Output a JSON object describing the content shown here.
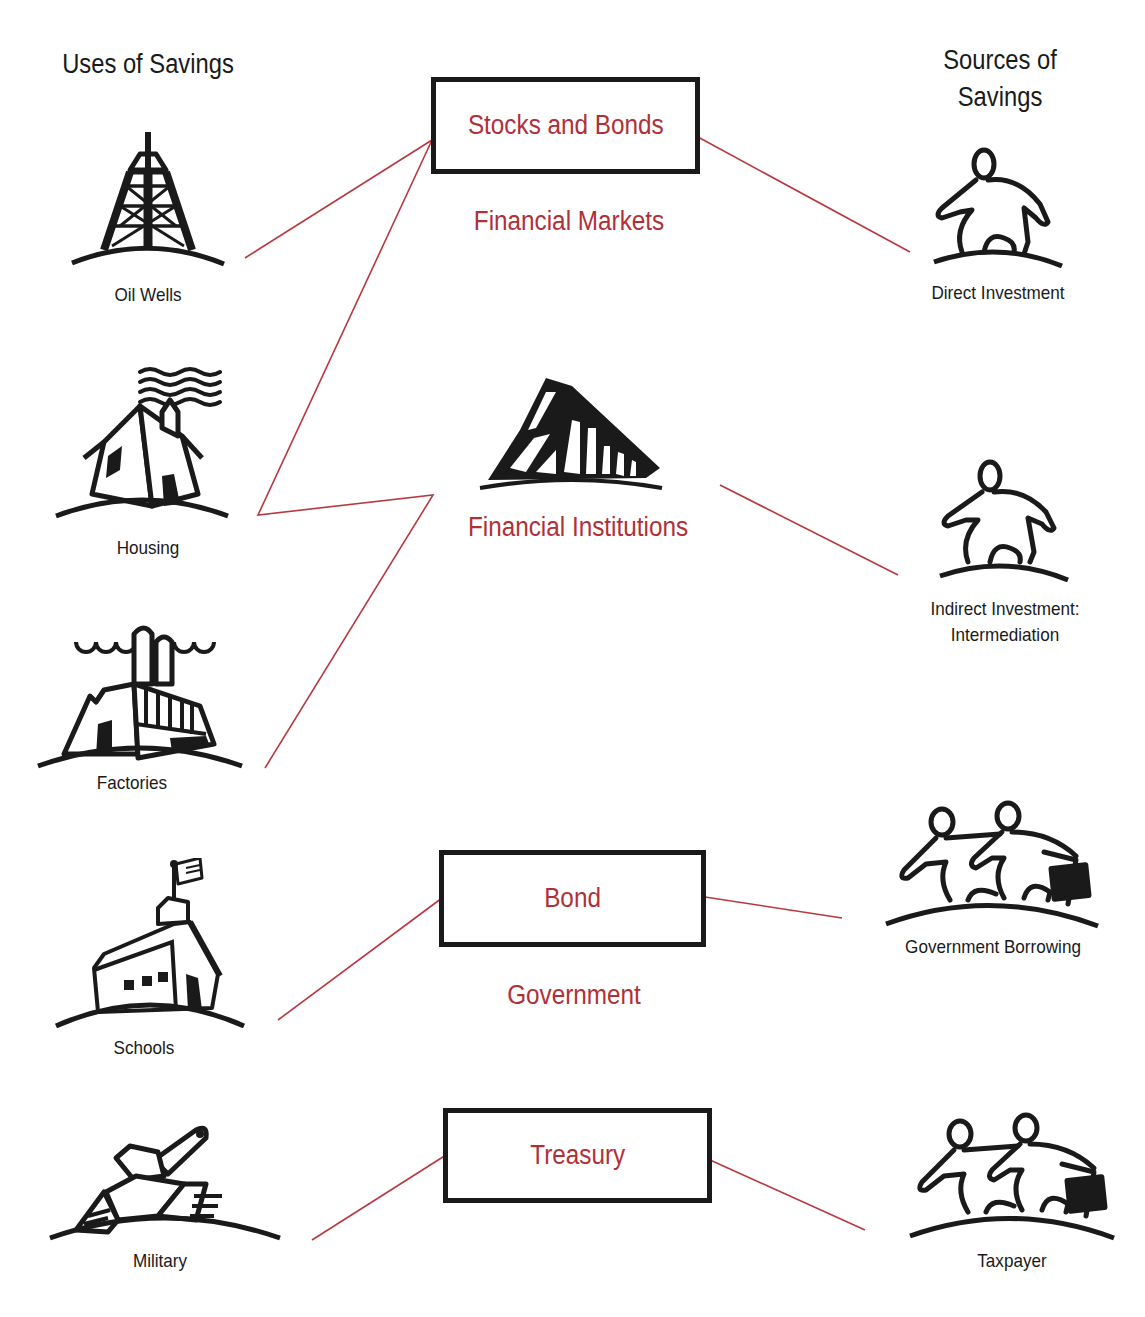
{
  "headings": {
    "uses": "Uses of Savings",
    "sources_line1": "Sources of",
    "sources_line2": "Savings"
  },
  "uses": [
    {
      "label": "Oil Wells",
      "icon": "oil-derrick-icon"
    },
    {
      "label": "Housing",
      "icon": "house-icon"
    },
    {
      "label": "Factories",
      "icon": "factory-icon"
    },
    {
      "label": "Schools",
      "icon": "schoolhouse-icon"
    },
    {
      "label": "Military",
      "icon": "tank-icon"
    }
  ],
  "sources": [
    {
      "label": "Direct Investment",
      "icon": "person-icon"
    },
    {
      "label_line1": "Indirect Investment:",
      "label_line2": "Intermediation",
      "icon": "person-icon"
    },
    {
      "label": "Government Borrowing",
      "icon": "two-people-briefcase-icon"
    },
    {
      "label": "Taxpayer",
      "icon": "two-people-briefcase-icon"
    }
  ],
  "channels": {
    "stocks_box": "Stocks and Bonds",
    "financial_markets": "Financial Markets",
    "financial_institutions": "Financial Institutions",
    "bond_box": "Bond",
    "government": "Government",
    "treasury_box": "Treasury"
  },
  "colors": {
    "connector": "#b8383f",
    "channel_text": "#b03038",
    "ink": "#1a1a1a"
  },
  "connections": [
    {
      "from": "Oil Wells",
      "to": "Stocks and Bonds"
    },
    {
      "from": "Housing",
      "to": "Stocks and Bonds"
    },
    {
      "from": "Housing",
      "to": "Financial Institutions"
    },
    {
      "from": "Factories",
      "to": "Financial Institutions"
    },
    {
      "from": "Stocks and Bonds",
      "to": "Direct Investment"
    },
    {
      "from": "Financial Institutions",
      "to": "Indirect Investment: Intermediation"
    },
    {
      "from": "Schools",
      "to": "Bond"
    },
    {
      "from": "Bond",
      "to": "Government Borrowing"
    },
    {
      "from": "Military",
      "to": "Treasury"
    },
    {
      "from": "Treasury",
      "to": "Taxpayer"
    }
  ]
}
